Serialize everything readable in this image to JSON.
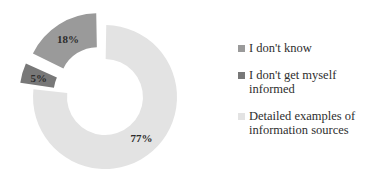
{
  "chart_data": {
    "type": "pie",
    "variant": "doughnut-exploded",
    "title": "",
    "xlabel": "",
    "ylabel": "",
    "categories": [
      "I don't know",
      "I don't get myself informed",
      "Detailed examples of information sources"
    ],
    "values": [
      18,
      5,
      77
    ],
    "value_labels": [
      "18%",
      "5%",
      "77%"
    ],
    "colors": [
      "#9a9a9a",
      "#787878",
      "#e3e3e3"
    ],
    "legend_position": "right",
    "grid": false,
    "units": "percent",
    "total": 100
  },
  "legend": {
    "items": [
      {
        "label": "I don't know",
        "color": "#9a9a9a",
        "value_label": "18%"
      },
      {
        "label": "I don't get myself\ninformed",
        "color": "#787878",
        "value_label": "5%"
      },
      {
        "label": "Detailed examples of\ninformation sources",
        "color": "#e3e3e3",
        "value_label": "77%"
      }
    ]
  },
  "labels": {
    "slice_1": "18%",
    "slice_2": "5%",
    "slice_3": "77%"
  }
}
